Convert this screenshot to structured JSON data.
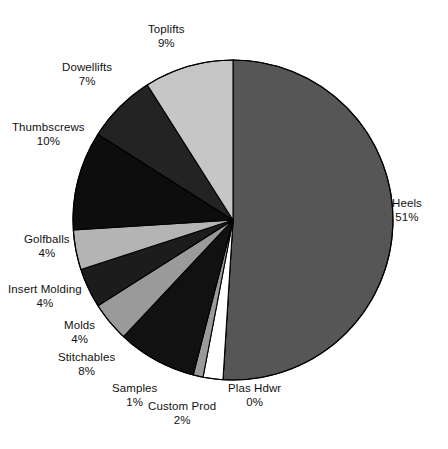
{
  "chart_data": {
    "type": "pie",
    "title": "",
    "subtitle": "",
    "xlabel": "",
    "ylabel": "",
    "legend_position": "none",
    "labels_show_percent": true,
    "start_angle_deg": 0,
    "direction": "clockwise",
    "categories": [
      "Heels",
      "Plas Hdwr",
      "Custom Prod",
      "Samples",
      "Stitchables",
      "Molds",
      "Insert Molding",
      "Golfballs",
      "Thumbscrews",
      "Dowellifts",
      "Toplifts"
    ],
    "values": [
      51,
      0,
      2,
      1,
      8,
      4,
      4,
      4,
      10,
      7,
      9
    ],
    "slices": [
      {
        "name": "Heels",
        "percent": 51,
        "percent_text": "51%",
        "color": "#565656"
      },
      {
        "name": "Plas Hdwr",
        "percent": 0,
        "percent_text": "0%",
        "color": "#ffffff"
      },
      {
        "name": "Custom Prod",
        "percent": 2,
        "percent_text": "2%",
        "color": "#ffffff"
      },
      {
        "name": "Samples",
        "percent": 1,
        "percent_text": "1%",
        "color": "#9a9a9a"
      },
      {
        "name": "Stitchables",
        "percent": 8,
        "percent_text": "8%",
        "color": "#111111"
      },
      {
        "name": "Molds",
        "percent": 4,
        "percent_text": "4%",
        "color": "#9a9a9a"
      },
      {
        "name": "Insert Molding",
        "percent": 4,
        "percent_text": "4%",
        "color": "#1c1c1c"
      },
      {
        "name": "Golfballs",
        "percent": 4,
        "percent_text": "4%",
        "color": "#b4b4b4"
      },
      {
        "name": "Thumbscrews",
        "percent": 10,
        "percent_text": "10%",
        "color": "#0d0d0d"
      },
      {
        "name": "Dowellifts",
        "percent": 7,
        "percent_text": "7%",
        "color": "#232323"
      },
      {
        "name": "Toplifts",
        "percent": 9,
        "percent_text": "9%",
        "color": "#c6c6c6"
      }
    ]
  },
  "geometry": {
    "center_x": 233,
    "center_y": 220,
    "radius": 160,
    "outline_color": "#000000",
    "outline_width": 1.2
  },
  "labels": [
    {
      "name": "Toplifts",
      "percent_text": "9%",
      "x": 148,
      "y": 22,
      "align": "center"
    },
    {
      "name": "Dowellifts",
      "percent_text": "7%",
      "x": 62,
      "y": 60,
      "align": "center"
    },
    {
      "name": "Thumbscrews",
      "percent_text": "10%",
      "x": 12,
      "y": 120,
      "align": "center"
    },
    {
      "name": "Golfballs",
      "percent_text": "4%",
      "x": 24,
      "y": 232,
      "align": "center"
    },
    {
      "name": "Insert Molding",
      "percent_text": "4%",
      "x": 8,
      "y": 282,
      "align": "center"
    },
    {
      "name": "Molds",
      "percent_text": "4%",
      "x": 64,
      "y": 318,
      "align": "center"
    },
    {
      "name": "Stitchables",
      "percent_text": "8%",
      "x": 58,
      "y": 350,
      "align": "center"
    },
    {
      "name": "Samples",
      "percent_text": "1%",
      "x": 112,
      "y": 381,
      "align": "center"
    },
    {
      "name": "Custom Prod",
      "percent_text": "2%",
      "x": 148,
      "y": 399,
      "align": "center"
    },
    {
      "name": "Plas Hdwr",
      "percent_text": "0%",
      "x": 228,
      "y": 381,
      "align": "center"
    },
    {
      "name": "Heels",
      "percent_text": "51%",
      "x": 392,
      "y": 196,
      "align": "center"
    }
  ]
}
